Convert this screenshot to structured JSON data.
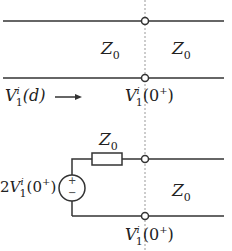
{
  "diagram": {
    "top_section": {
      "left_impedance": {
        "symbol": "Z",
        "subscript": "0"
      },
      "right_impedance": {
        "symbol": "Z",
        "subscript": "0"
      },
      "incident_label": {
        "symbol": "V",
        "subscript": "1",
        "superscript": "i",
        "arg": "(d)"
      },
      "arrow": "→",
      "junction_label": {
        "symbol": "V",
        "subscript": "1",
        "superscript": "i",
        "arg": "(0",
        "arg_sup": "+",
        "arg_close": ")"
      }
    },
    "bottom_section": {
      "source_label": {
        "prefix": "2",
        "symbol": "V",
        "subscript": "1",
        "superscript": "i",
        "arg": "(0",
        "arg_sup": "+",
        "arg_close": ")"
      },
      "source_polarity": {
        "plus": "+",
        "minus": "−"
      },
      "series_impedance": {
        "symbol": "Z",
        "subscript": "0"
      },
      "line_impedance": {
        "symbol": "Z",
        "subscript": "0"
      },
      "junction_label": {
        "symbol": "V",
        "subscript": "1",
        "superscript": "i",
        "arg": "(0",
        "arg_sup": "+",
        "arg_close": ")"
      }
    },
    "colors": {
      "line": "#333333",
      "dashed": "#999999",
      "background": "#ffffff"
    }
  }
}
